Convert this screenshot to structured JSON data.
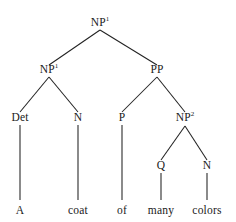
{
  "diagram": {
    "type": "syntax-tree",
    "sentence": "A coat of many colors",
    "background_color": "#ffffff",
    "line_color": "#222222",
    "text_color": "#1a1a1a",
    "nodes": {
      "root": {
        "label": "NP",
        "superscript": "1"
      },
      "np1": {
        "label": "NP",
        "superscript": "1"
      },
      "pp": {
        "label": "PP",
        "superscript": ""
      },
      "det": {
        "label": "Det",
        "superscript": ""
      },
      "n1": {
        "label": "N",
        "superscript": ""
      },
      "p": {
        "label": "P",
        "superscript": ""
      },
      "np2": {
        "label": "NP",
        "superscript": "2"
      },
      "q": {
        "label": "Q",
        "superscript": ""
      },
      "n2": {
        "label": "N",
        "superscript": ""
      }
    },
    "terminals": {
      "t_a": "A",
      "t_coat": "coat",
      "t_of": "of",
      "t_many": "many",
      "t_colors": "colors"
    }
  }
}
